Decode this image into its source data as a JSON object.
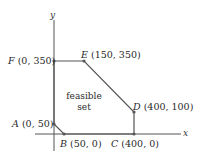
{
  "diagram": {
    "type": "feasible-region-polygon",
    "axes": {
      "x_label": "x",
      "y_label": "y"
    },
    "region_label_line1": "feasible",
    "region_label_line2": "set",
    "colors": {
      "line": "#555555",
      "point": "#555555",
      "text": "#2a2a2a"
    },
    "points": [
      {
        "id": "A",
        "name": "A",
        "coords": "(0, 50)"
      },
      {
        "id": "B",
        "name": "B",
        "coords": "(50, 0)"
      },
      {
        "id": "C",
        "name": "C",
        "coords": "(400, 0)"
      },
      {
        "id": "D",
        "name": "D",
        "coords": "(400, 100)"
      },
      {
        "id": "E",
        "name": "E",
        "coords": "(150, 350)"
      },
      {
        "id": "F",
        "name": "F",
        "coords": "(0, 350)"
      }
    ]
  }
}
